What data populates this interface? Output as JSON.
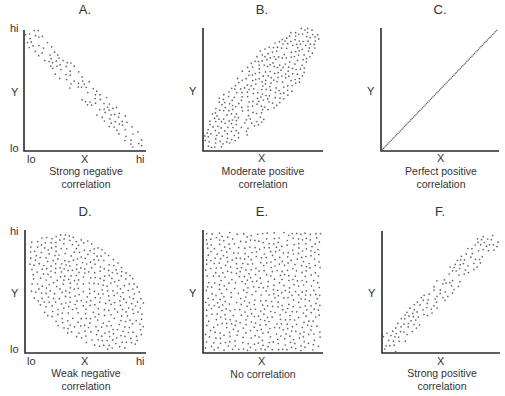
{
  "figure": {
    "panels": [
      {
        "id": "A",
        "title": "A.",
        "caption_line1": "Strong negative",
        "caption_line2": "correlation",
        "x_label": "X",
        "y_label": "Y",
        "x_lo": "lo",
        "x_hi": "hi",
        "y_lo": "lo",
        "y_hi": "hi",
        "show_ticks": true
      },
      {
        "id": "B",
        "title": "B.",
        "caption_line1": "Moderate positive",
        "caption_line2": "correlation",
        "x_label": "X",
        "y_label": "Y",
        "show_ticks": false
      },
      {
        "id": "C",
        "title": "C.",
        "caption_line1": "Perfect positive",
        "caption_line2": "correlation",
        "x_label": "X",
        "y_label": "Y",
        "show_ticks": false
      },
      {
        "id": "D",
        "title": "D.",
        "caption_line1": "Weak negative",
        "caption_line2": "correlation",
        "x_label": "X",
        "y_label": "Y",
        "x_lo": "lo",
        "x_hi": "hi",
        "y_lo": "lo",
        "y_hi": "hi",
        "show_ticks": true
      },
      {
        "id": "E",
        "title": "E.",
        "caption_line1": "No correlation",
        "caption_line2": "",
        "x_label": "X",
        "y_label": "Y",
        "show_ticks": false
      },
      {
        "id": "F",
        "title": "F.",
        "caption_line1": "Strong positive",
        "caption_line2": "correlation",
        "x_label": "X",
        "y_label": "Y",
        "show_ticks": false
      }
    ]
  },
  "chart_data": [
    {
      "type": "scatter",
      "title": "A.",
      "subtitle": "Strong negative correlation",
      "xlabel": "X",
      "ylabel": "Y",
      "x_ticks": [
        "lo",
        "hi"
      ],
      "y_ticks": [
        "lo",
        "hi"
      ],
      "grid": false,
      "shape": "narrow-band",
      "slope": "negative",
      "correlation": "strong negative",
      "band_width_fraction": 0.16,
      "n_points": 110,
      "from": [
        0.02,
        0.98
      ],
      "to": [
        0.97,
        0.04
      ]
    },
    {
      "type": "scatter",
      "title": "B.",
      "subtitle": "Moderate positive correlation",
      "xlabel": "X",
      "ylabel": "Y",
      "grid": false,
      "shape": "wide-band",
      "slope": "positive",
      "correlation": "moderate positive",
      "band_width_fraction": 0.42,
      "n_points": 300,
      "from": [
        0.04,
        0.04
      ],
      "to": [
        0.92,
        0.98
      ]
    },
    {
      "type": "scatter",
      "title": "C.",
      "subtitle": "Perfect positive correlation",
      "xlabel": "X",
      "ylabel": "Y",
      "grid": false,
      "shape": "line",
      "slope": "positive",
      "correlation": "perfect positive",
      "n_points": 90,
      "from": [
        0.0,
        0.0
      ],
      "to": [
        0.98,
        0.98
      ]
    },
    {
      "type": "scatter",
      "title": "D.",
      "subtitle": "Weak negative correlation",
      "xlabel": "X",
      "ylabel": "Y",
      "x_ticks": [
        "lo",
        "hi"
      ],
      "y_ticks": [
        "lo",
        "hi"
      ],
      "grid": false,
      "shape": "ellipse",
      "slope": "negative",
      "correlation": "weak negative",
      "n_points": 420,
      "center": [
        0.5,
        0.5
      ],
      "major_radius": 0.6,
      "minor_radius": 0.36,
      "angle_deg": -40
    },
    {
      "type": "scatter",
      "title": "E.",
      "subtitle": "No correlation",
      "xlabel": "X",
      "ylabel": "Y",
      "grid": false,
      "shape": "uniform-rectangle",
      "slope": "none",
      "correlation": "none",
      "n_points": 560,
      "from": [
        0.02,
        0.02
      ],
      "to": [
        0.98,
        0.98
      ]
    },
    {
      "type": "scatter",
      "title": "F.",
      "subtitle": "Strong positive correlation",
      "xlabel": "X",
      "ylabel": "Y",
      "grid": false,
      "shape": "narrow-band",
      "slope": "positive",
      "correlation": "strong positive",
      "band_width_fraction": 0.17,
      "n_points": 130,
      "from": [
        0.02,
        0.03
      ],
      "to": [
        0.95,
        0.96
      ]
    }
  ],
  "layout": {
    "plots": [
      {
        "ox": 24,
        "oy": 151,
        "w": 122,
        "h": 121
      },
      {
        "ox": 203,
        "oy": 151,
        "w": 120,
        "h": 123
      },
      {
        "ox": 381,
        "oy": 151,
        "w": 118,
        "h": 123
      },
      {
        "ox": 25,
        "oy": 353,
        "w": 121,
        "h": 123
      },
      {
        "ox": 203,
        "oy": 353,
        "w": 120,
        "h": 123
      },
      {
        "ox": 382,
        "oy": 353,
        "w": 118,
        "h": 122
      }
    ]
  }
}
